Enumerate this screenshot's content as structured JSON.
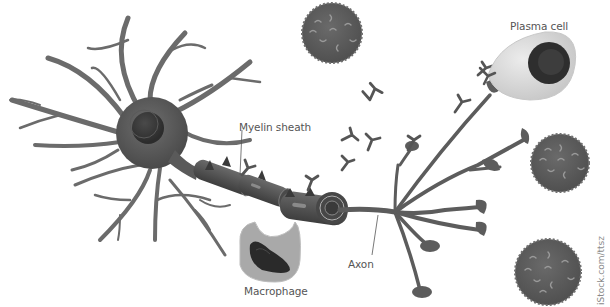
{
  "diagram": {
    "labels": {
      "plasma_cell": "Plasma cell",
      "myelin_sheath": "Myelin sheath",
      "axon": "Axon",
      "macrophage": "Macrophage"
    },
    "credit": "iStock.com/ttsz",
    "colors": {
      "background": "#ffffff",
      "neuron": "#6b6b6b",
      "neuron_dark": "#4a4a4a",
      "nucleus": "#3a3a3a",
      "lymphocyte": "#5e5e5e",
      "lymphocyte_spot": "#9a9a9a",
      "plasma_cell": "#d8d8d8",
      "plasma_nucleus": "#2e2e2e",
      "macrophage": "#a9a9a9",
      "macrophage_nucleus": "#2a2a2a",
      "label_text": "#555555"
    },
    "elements": [
      "neuron",
      "dendrites",
      "myelin-sheath",
      "axon",
      "axon-terminals",
      "antibodies",
      "plasma-cell",
      "macrophage",
      "lymphocytes"
    ]
  }
}
